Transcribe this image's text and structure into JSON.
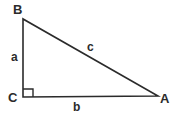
{
  "figure": {
    "kind": "right-triangle-geometry-diagram",
    "background_color": "#ffffff",
    "stroke_color": "#2b2b2b",
    "text_color": "#2b2b2b",
    "vertices": [
      {
        "id": "B",
        "label": "B",
        "x": 23,
        "y": 19
      },
      {
        "id": "C",
        "label": "C",
        "x": 23,
        "y": 97
      },
      {
        "id": "A",
        "label": "A",
        "x": 158,
        "y": 96
      }
    ],
    "sides": [
      {
        "id": "a",
        "label": "a",
        "from": "B",
        "to": "C",
        "role": "leg-vertical"
      },
      {
        "id": "b",
        "label": "b",
        "from": "C",
        "to": "A",
        "role": "leg-horizontal"
      },
      {
        "id": "c",
        "label": "c",
        "from": "B",
        "to": "A",
        "role": "hypotenuse"
      }
    ],
    "right_angle": {
      "at_vertex": "C",
      "marker": "square",
      "size": 8
    },
    "polyline_points": "23,19 23,97 158,96 23,19",
    "right_angle_points": "33,97 33,89 23,89"
  }
}
